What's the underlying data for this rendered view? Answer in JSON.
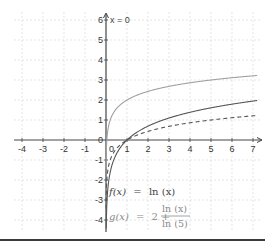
{
  "chart_data": {
    "type": "line",
    "title": "",
    "xlabel": "",
    "ylabel": "",
    "xlim": [
      -4.1,
      7.2
    ],
    "ylim": [
      -4.3,
      6.2
    ],
    "grid": true,
    "x_ticks": [
      "-4",
      "-3",
      "-2",
      "-1",
      "0",
      "1",
      "2",
      "3",
      "4",
      "5",
      "6",
      "7"
    ],
    "y_ticks": [
      "-4",
      "-3",
      "-2",
      "-1",
      "0",
      "1",
      "2",
      "3",
      "4",
      "5",
      "6"
    ],
    "annotations": [
      {
        "text": "x = 0",
        "x": 0,
        "y": 6,
        "note": "vertical asymptote label"
      }
    ],
    "series": [
      {
        "name": "f(x) = ln(x)",
        "style": "solid",
        "color": "#555555",
        "x": [
          0.05,
          0.1,
          0.2,
          0.3,
          0.5,
          0.75,
          1,
          1.5,
          2,
          3,
          4,
          5,
          6,
          7
        ],
        "values": [
          -3.0,
          -2.3,
          -1.61,
          -1.2,
          -0.69,
          -0.29,
          0,
          0.41,
          0.69,
          1.1,
          1.39,
          1.61,
          1.79,
          1.95
        ]
      },
      {
        "name": "g(x) = 2 + ln(x)/ln(5)",
        "style": "solid",
        "color": "#a0a0a0",
        "x": [
          0.01,
          0.02,
          0.05,
          0.1,
          0.2,
          0.3,
          0.5,
          0.75,
          1,
          1.5,
          2,
          3,
          4,
          5,
          6,
          7
        ],
        "values": [
          -0.86,
          -0.43,
          0.14,
          0.57,
          1.0,
          1.25,
          1.57,
          1.82,
          2.0,
          2.25,
          2.43,
          2.68,
          2.86,
          3.0,
          3.11,
          3.21
        ]
      },
      {
        "name": "ln(x)/ln(5)",
        "style": "dashed",
        "color": "#555555",
        "x": [
          0.01,
          0.02,
          0.05,
          0.1,
          0.2,
          0.3,
          0.5,
          0.75,
          1,
          1.5,
          2,
          3,
          4,
          5,
          6,
          7
        ],
        "values": [
          -2.86,
          -2.43,
          -1.86,
          -1.43,
          -1.0,
          -0.75,
          -0.43,
          -0.18,
          0,
          0.25,
          0.43,
          0.68,
          0.86,
          1.0,
          1.11,
          1.21
        ]
      }
    ],
    "legend": [
      {
        "label": "f(x) = ln(x)",
        "position": "lower-middle"
      },
      {
        "label": "g(x) = 2 + ln(x)/ln(5)",
        "position": "lower-middle"
      }
    ]
  },
  "labels": {
    "asymptote": "x = 0",
    "f_lhs": "f(x)",
    "f_eq": "=",
    "f_rhs": "ln (x)",
    "g_lhs": "g(x)",
    "g_eq": "=",
    "g_two_plus": "2 +",
    "g_num": "ln (x)",
    "g_den": "ln (5)"
  },
  "colors": {
    "grid": "#d8d8d8",
    "axis": "#444444",
    "f_curve": "#555555",
    "g_curve": "#a0a0a0",
    "dashed_curve": "#555555",
    "g_label": "#8a8a8a",
    "f_label": "#444444"
  }
}
